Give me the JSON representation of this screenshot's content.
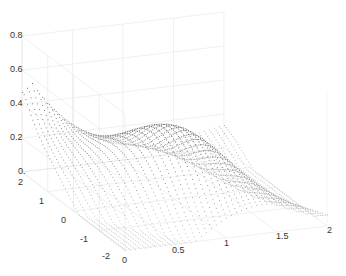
{
  "chart_data": {
    "type": "scatter3d",
    "title": "",
    "xlabel": "",
    "ylabel": "",
    "zlabel": "",
    "grid": true,
    "x_ticks": [
      "0",
      "0.5",
      "1",
      "1.5",
      "2"
    ],
    "y_ticks": [
      "-2",
      "-1",
      "0",
      "1",
      "2"
    ],
    "z_ticks": [
      "0.",
      "0.2",
      "0.4",
      "0.6",
      "0.8"
    ],
    "xlim": [
      0,
      2
    ],
    "ylim": [
      -2,
      2
    ],
    "zlim": [
      0,
      0.8
    ],
    "marker_color": "#444444"
  },
  "axes": {
    "z": {
      "labels": [
        "0.8",
        "0.6",
        "0.4",
        "0.2",
        "0."
      ]
    },
    "y": {
      "labels": [
        "2",
        "1",
        "0",
        "-1",
        "-2"
      ]
    },
    "x": {
      "labels": [
        "0",
        "0.5",
        "1",
        "1.5",
        "2"
      ]
    }
  }
}
